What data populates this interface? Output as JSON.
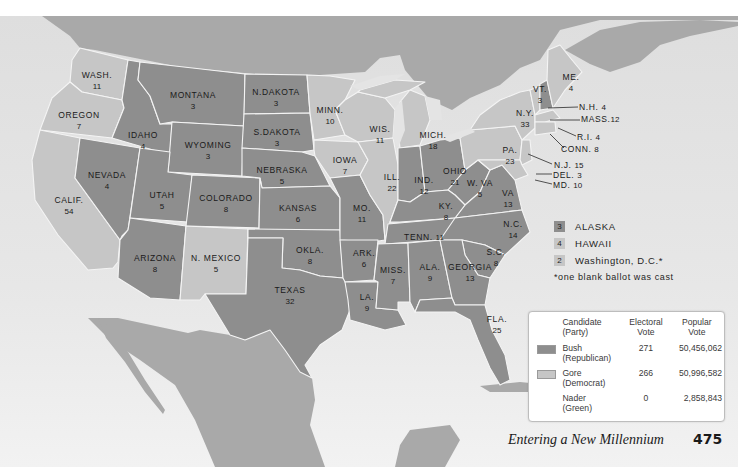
{
  "page": {
    "footer_title": "Entering a New Millennium",
    "page_number": "475"
  },
  "colors": {
    "republican": "#8e8e8e",
    "democrat": "#c6c6c6",
    "water": "#e3e3e3",
    "foreign_land": "#a9a9a9",
    "border": "#f4f4f4"
  },
  "states": {
    "wash": {
      "name": "WASH.",
      "votes": "11",
      "winner": "Gore"
    },
    "oregon": {
      "name": "OREGON",
      "votes": "7",
      "winner": "Gore"
    },
    "calif": {
      "name": "CALIF.",
      "votes": "54",
      "winner": "Gore"
    },
    "idaho": {
      "name": "IDAHO",
      "votes": "4",
      "winner": "Bush"
    },
    "nevada": {
      "name": "NEVADA",
      "votes": "4",
      "winner": "Bush"
    },
    "montana": {
      "name": "MONTANA",
      "votes": "3",
      "winner": "Bush"
    },
    "wyoming": {
      "name": "WYOMING",
      "votes": "3",
      "winner": "Bush"
    },
    "utah": {
      "name": "UTAH",
      "votes": "5",
      "winner": "Bush"
    },
    "colorado": {
      "name": "COLORADO",
      "votes": "8",
      "winner": "Bush"
    },
    "arizona": {
      "name": "ARIZONA",
      "votes": "8",
      "winner": "Bush"
    },
    "nmexico": {
      "name": "N. MEXICO",
      "votes": "5",
      "winner": "Gore"
    },
    "ndakota": {
      "name": "N.DAKOTA",
      "votes": "3",
      "winner": "Bush"
    },
    "sdakota": {
      "name": "S.DAKOTA",
      "votes": "3",
      "winner": "Bush"
    },
    "nebraska": {
      "name": "NEBRASKA",
      "votes": "5",
      "winner": "Bush"
    },
    "kansas": {
      "name": "KANSAS",
      "votes": "6",
      "winner": "Bush"
    },
    "okla": {
      "name": "OKLA.",
      "votes": "8",
      "winner": "Bush"
    },
    "texas": {
      "name": "TEXAS",
      "votes": "32",
      "winner": "Bush"
    },
    "minn": {
      "name": "MINN.",
      "votes": "10",
      "winner": "Gore"
    },
    "iowa": {
      "name": "IOWA",
      "votes": "7",
      "winner": "Gore"
    },
    "mo": {
      "name": "MO.",
      "votes": "11",
      "winner": "Bush"
    },
    "ark": {
      "name": "ARK.",
      "votes": "6",
      "winner": "Bush"
    },
    "la": {
      "name": "LA.",
      "votes": "9",
      "winner": "Bush"
    },
    "wis": {
      "name": "WIS.",
      "votes": "11",
      "winner": "Gore"
    },
    "ill": {
      "name": "ILL.",
      "votes": "22",
      "winner": "Gore"
    },
    "mich": {
      "name": "MICH.",
      "votes": "18",
      "winner": "Gore"
    },
    "ind": {
      "name": "IND.",
      "votes": "12",
      "winner": "Bush"
    },
    "ohio": {
      "name": "OHIO",
      "votes": "21",
      "winner": "Bush"
    },
    "ky": {
      "name": "KY.",
      "votes": "8",
      "winner": "Bush"
    },
    "tenn": {
      "name": "TENN.",
      "votes": "11",
      "winner": "Bush"
    },
    "miss": {
      "name": "MISS.",
      "votes": "7",
      "winner": "Bush"
    },
    "ala": {
      "name": "ALA.",
      "votes": "9",
      "winner": "Bush"
    },
    "georgia": {
      "name": "GEORGIA",
      "votes": "13",
      "winner": "Bush"
    },
    "fla": {
      "name": "FLA.",
      "votes": "25",
      "winner": "Bush"
    },
    "sc": {
      "name": "S.C.",
      "votes": "8",
      "winner": "Bush"
    },
    "nc": {
      "name": "N.C.",
      "votes": "14",
      "winner": "Bush"
    },
    "va": {
      "name": "VA",
      "votes": "13",
      "winner": "Bush"
    },
    "wva": {
      "name": "W. VA",
      "votes": "5",
      "winner": "Bush"
    },
    "pa": {
      "name": "PA.",
      "votes": "23",
      "winner": "Gore"
    },
    "ny": {
      "name": "N.Y.",
      "votes": "33",
      "winner": "Gore"
    },
    "vt": {
      "name": "VT.",
      "votes": "3",
      "winner": "Gore"
    },
    "me": {
      "name": "ME.",
      "votes": "4",
      "winner": "Gore"
    },
    "nh": {
      "name": "N.H.",
      "votes": "4",
      "winner": "Bush"
    },
    "mass": {
      "name": "MASS.",
      "votes": "12",
      "winner": "Gore"
    },
    "ri": {
      "name": "R.I.",
      "votes": "4",
      "winner": "Gore"
    },
    "conn": {
      "name": "CONN.",
      "votes": "8",
      "winner": "Gore"
    },
    "nj": {
      "name": "N.J.",
      "votes": "15",
      "winner": "Gore"
    },
    "del": {
      "name": "DEL.",
      "votes": "3",
      "winner": "Gore"
    },
    "md": {
      "name": "MD.",
      "votes": "10",
      "winner": "Gore"
    }
  },
  "off_map": [
    {
      "votes": "3",
      "name": "ALASKA",
      "winner": "Bush"
    },
    {
      "votes": "4",
      "name": "HAWAII",
      "winner": "Gore"
    },
    {
      "votes": "2",
      "name": "Washington, D.C.*",
      "winner": "Gore"
    }
  ],
  "footnote": "*one blank ballot was cast",
  "results_table": {
    "headers": {
      "candidate": [
        "Candidate",
        "(Party)"
      ],
      "electoral": [
        "Electoral",
        "Vote"
      ],
      "popular": [
        "Popular",
        "Vote"
      ]
    },
    "rows": [
      {
        "name": "Bush",
        "party": "(Republican)",
        "electoral": "271",
        "popular": "50,456,062",
        "swatch": "republican"
      },
      {
        "name": "Gore",
        "party": "(Democrat)",
        "electoral": "266",
        "popular": "50,996,582",
        "swatch": "democrat"
      },
      {
        "name": "Nader",
        "party": "(Green)",
        "electoral": "0",
        "popular": "2,858,843",
        "swatch": "none"
      }
    ]
  }
}
